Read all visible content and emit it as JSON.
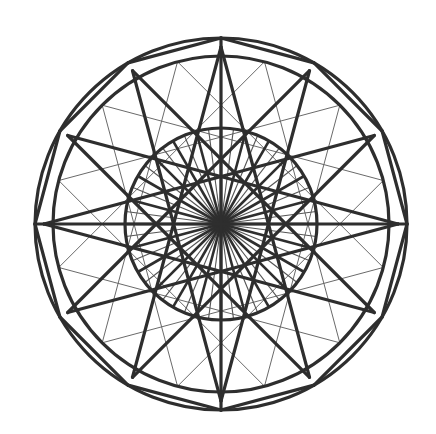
{
  "figure": {
    "title": "Twelve-fold geometric rosette",
    "center": [
      221,
      224
    ],
    "symmetry": 12,
    "outer_circle_radius": 186,
    "polygon_radius": 177,
    "inner_circle_radius": 168,
    "mid_circle_radius": 96,
    "star_step": 5,
    "thin_chord_step": 4,
    "spoke_count_thick": 12,
    "spoke_count_thin": 24,
    "colors": {
      "line": "#2e2e2e",
      "thin_line": "#6a6a6a",
      "background": "#ffffff"
    }
  }
}
